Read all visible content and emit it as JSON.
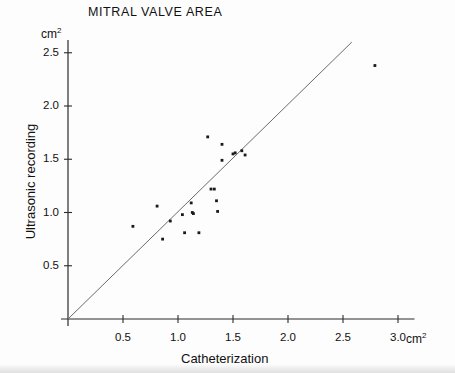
{
  "chart_data": {
    "type": "scatter",
    "title": "MITRAL VALVE AREA",
    "xlabel": "Catheterization",
    "ylabel": "Ultrasonic recording",
    "x_unit": "cm",
    "x_unit_exponent": "2",
    "y_unit": "cm",
    "y_unit_exponent": "2",
    "xlim": [
      0,
      3.15
    ],
    "ylim": [
      0,
      2.62
    ],
    "grid": false,
    "legend": null,
    "xticks": [
      "0.5",
      "1.0",
      "1.5",
      "2.0",
      "2.5",
      "3.0"
    ],
    "xtick_values": [
      0.5,
      1.0,
      1.5,
      2.0,
      2.5,
      3.0
    ],
    "yticks": [
      "0.5",
      "1.0",
      "1.5",
      "2.0",
      "2.5"
    ],
    "ytick_values": [
      0.5,
      1.0,
      1.5,
      2.0,
      2.5
    ],
    "reference_line": {
      "name": "identity-line",
      "description": "line of identity y = x",
      "x_start": 0.0,
      "y_start": 0.0,
      "x_end": 2.58,
      "y_end": 2.6
    },
    "points": [
      {
        "x": 0.59,
        "y": 0.87
      },
      {
        "x": 0.81,
        "y": 1.06
      },
      {
        "x": 0.86,
        "y": 0.75
      },
      {
        "x": 0.93,
        "y": 0.92
      },
      {
        "x": 1.04,
        "y": 0.98
      },
      {
        "x": 1.06,
        "y": 0.81
      },
      {
        "x": 1.12,
        "y": 1.09
      },
      {
        "x": 1.13,
        "y": 1.0
      },
      {
        "x": 1.14,
        "y": 0.99
      },
      {
        "x": 1.19,
        "y": 0.81
      },
      {
        "x": 1.27,
        "y": 1.71
      },
      {
        "x": 1.3,
        "y": 1.22
      },
      {
        "x": 1.33,
        "y": 1.22
      },
      {
        "x": 1.35,
        "y": 1.11
      },
      {
        "x": 1.36,
        "y": 1.01
      },
      {
        "x": 1.4,
        "y": 1.64
      },
      {
        "x": 1.4,
        "y": 1.49
      },
      {
        "x": 1.5,
        "y": 1.55
      },
      {
        "x": 1.52,
        "y": 1.56
      },
      {
        "x": 1.58,
        "y": 1.58
      },
      {
        "x": 1.61,
        "y": 1.54
      },
      {
        "x": 2.79,
        "y": 2.38
      }
    ]
  },
  "icons": {
    "data_point": "dot-marker"
  },
  "colors": {
    "axis": "#2b2b2b",
    "marker": "#1a1a1a",
    "reference_line": "#6b6b6b",
    "text": "#111111",
    "background": "#ffffff"
  }
}
